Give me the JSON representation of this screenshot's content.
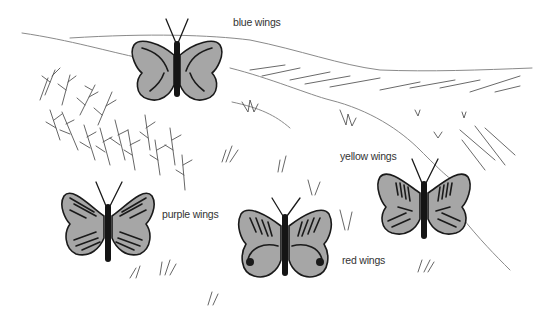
{
  "scene": {
    "description": "Landscape illustration with four butterflies",
    "background_color": "#ffffff",
    "wing_fill_color": "#a6a6a6",
    "outline_color": "#1a1a1a"
  },
  "butterflies": [
    {
      "id": "blue",
      "label": "blue wings",
      "marking": "curved-streaks"
    },
    {
      "id": "purple",
      "label": "purple wings",
      "marking": "hatched-lines"
    },
    {
      "id": "red",
      "label": "red wings",
      "marking": "eyespot-swirls"
    },
    {
      "id": "yellow",
      "label": "yellow wings",
      "marking": "vertical-dashes"
    }
  ]
}
